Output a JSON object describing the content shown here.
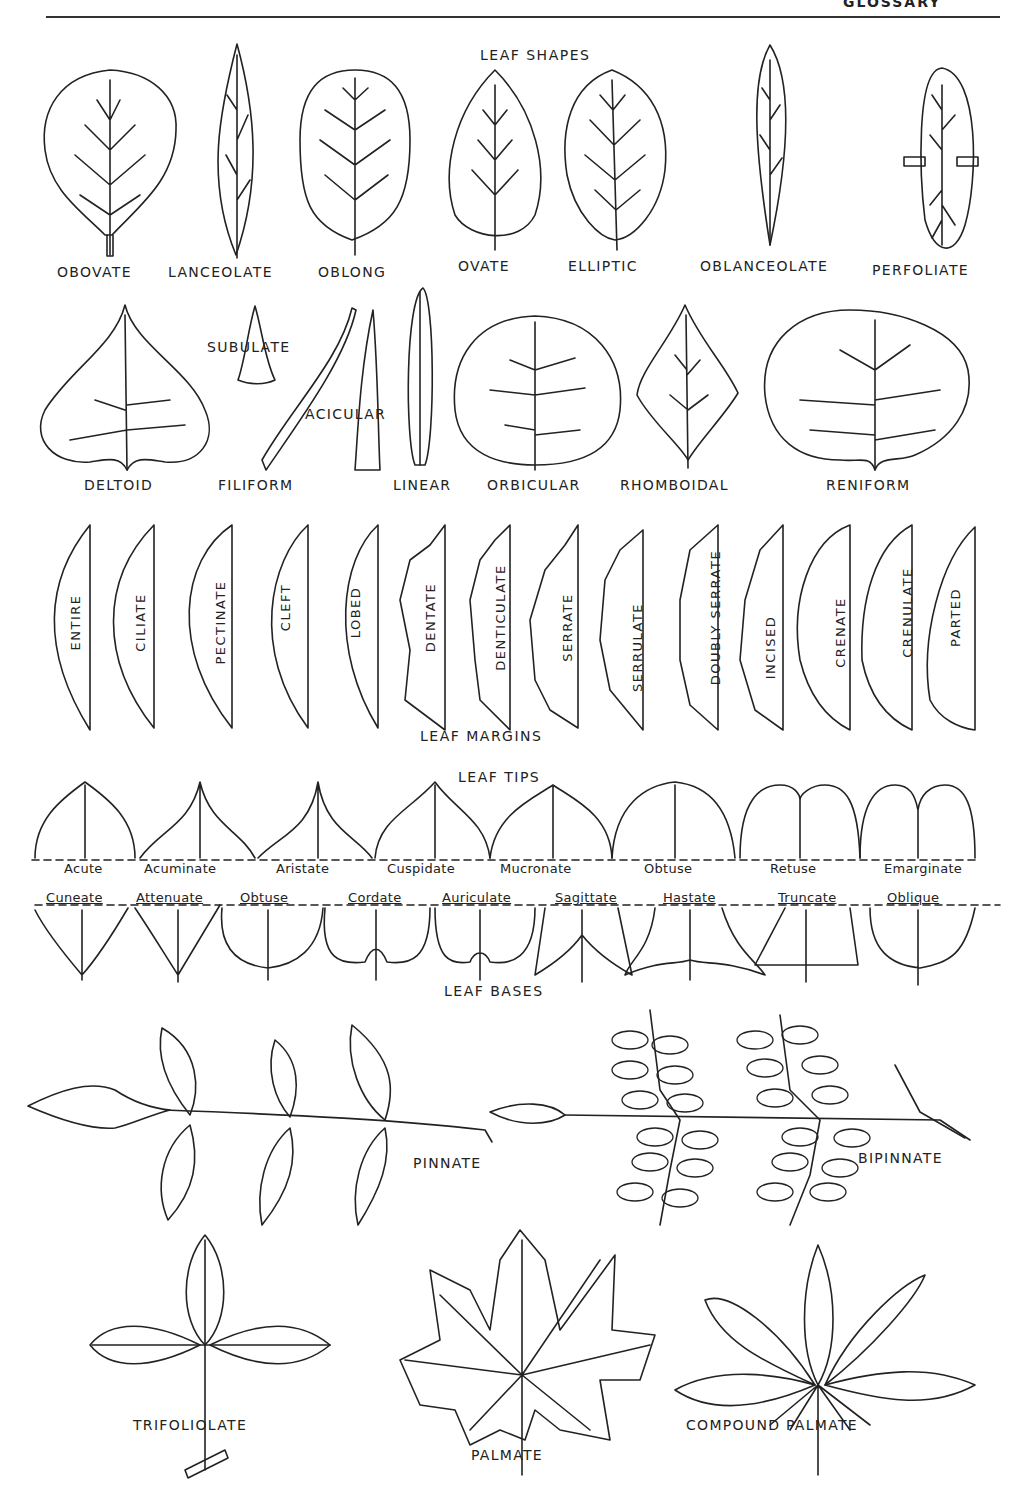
{
  "header": {
    "running_title": "GLOSSARY"
  },
  "sections": {
    "leaf_shapes": {
      "title": "LEAF SHAPES",
      "row1": [
        "OBOVATE",
        "LANCEOLATE",
        "OBLONG",
        "OVATE",
        "ELLIPTIC",
        "OBLANCEOLATE",
        "PERFOLIATE"
      ],
      "row2": [
        "DELTOID",
        "SUBULATE",
        "FILIFORM",
        "ACICULAR",
        "LINEAR",
        "ORBICULAR",
        "RHOMBOIDAL",
        "RENIFORM"
      ]
    },
    "leaf_margins": {
      "title": "LEAF MARGINS",
      "items": [
        "ENTIRE",
        "CILIATE",
        "PECTINATE",
        "CLEFT",
        "LOBED",
        "DENTATE",
        "DENTICULATE",
        "SERRATE",
        "SERRULATE",
        "DOUBLY SERRATE",
        "INCISED",
        "CRENATE",
        "CRENULATE",
        "PARTED"
      ]
    },
    "leaf_tips": {
      "title": "LEAF TIPS",
      "items": [
        "Acute",
        "Acuminate",
        "Aristate",
        "Cuspidate",
        "Mucronate",
        "Obtuse",
        "Retuse",
        "Emarginate"
      ]
    },
    "leaf_bases": {
      "title": "LEAF BASES",
      "items": [
        "Cuneate",
        "Attenuate",
        "Obtuse",
        "Cordate",
        "Auriculate",
        "Sagittate",
        "Hastate",
        "Truncate",
        "Oblique"
      ]
    },
    "compound_leaves": {
      "items": [
        "PINNATE",
        "BIPINNATE",
        "TRIFOLIOLATE",
        "PALMATE",
        "COMPOUND PALMATE"
      ]
    }
  }
}
